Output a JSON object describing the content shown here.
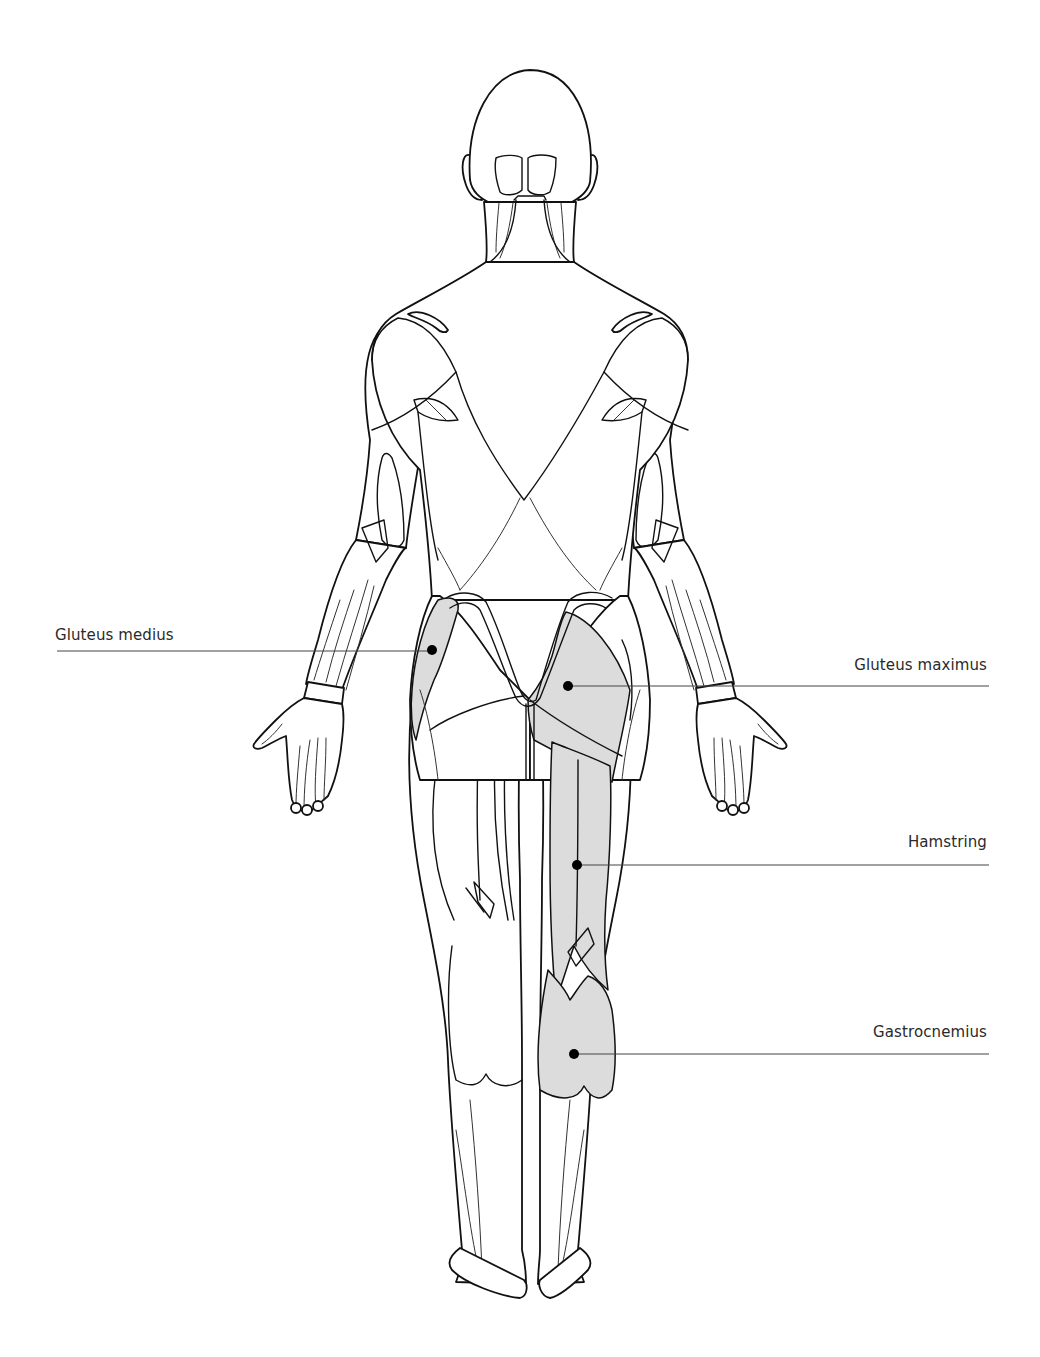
{
  "diagram": {
    "title": "",
    "view": "posterior",
    "highlight_color": "#dcdcdc",
    "labels": [
      {
        "id": "gluteus-medius",
        "text": "Gluteus medius",
        "side": "left"
      },
      {
        "id": "gluteus-maximus",
        "text": "Gluteus maximus",
        "side": "right"
      },
      {
        "id": "hamstring",
        "text": "Hamstring",
        "side": "right"
      },
      {
        "id": "gastrocnemius",
        "text": "Gastrocnemius",
        "side": "right"
      }
    ]
  }
}
